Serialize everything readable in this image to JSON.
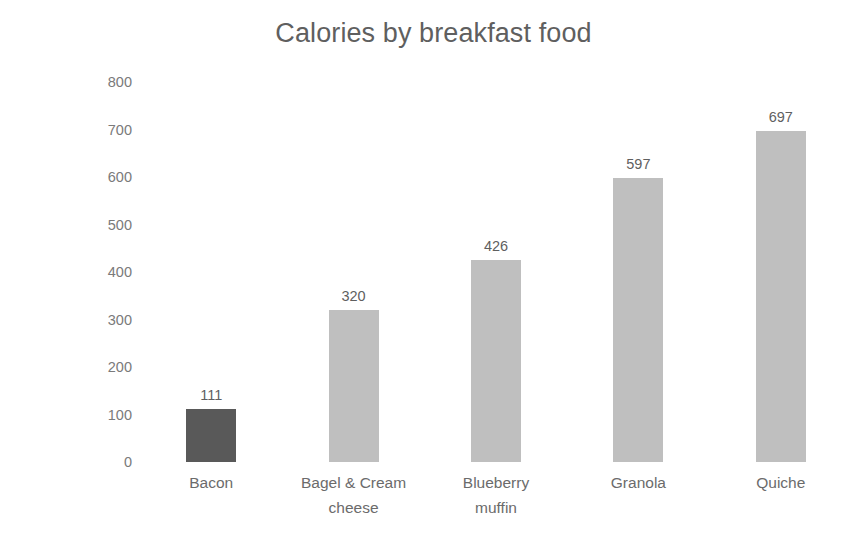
{
  "chart_data": {
    "type": "bar",
    "title": "Calories by breakfast food",
    "xlabel": "",
    "ylabel": "Calories per serving",
    "categories": [
      "Bacon",
      "Bagel & Cream cheese",
      "Blueberry muffin",
      "Granola",
      "Quiche"
    ],
    "category_lines": [
      [
        "Bacon"
      ],
      [
        "Bagel & Cream",
        "cheese"
      ],
      [
        "Blueberry",
        "muffin"
      ],
      [
        "Granola"
      ],
      [
        "Quiche"
      ]
    ],
    "values": [
      111,
      320,
      426,
      597,
      697
    ],
    "value_labels": [
      "111",
      "320",
      "426",
      "597",
      "697"
    ],
    "ylim": [
      0,
      800
    ],
    "ytick_values": [
      800,
      700,
      600,
      500,
      400,
      300,
      200,
      100,
      0
    ],
    "ytick_labels": [
      "800",
      "700",
      "600",
      "500",
      "400",
      "300",
      "200",
      "100",
      "0"
    ],
    "grid": false,
    "legend": "none",
    "bar_colors": [
      "#595959",
      "#bfbfbf",
      "#bfbfbf",
      "#bfbfbf",
      "#bfbfbf"
    ],
    "highlighted_category": "Bacon",
    "title_color": "#5f5f5f",
    "axis_text_color": "#7a7a7a",
    "background_color": "#ffffff"
  }
}
